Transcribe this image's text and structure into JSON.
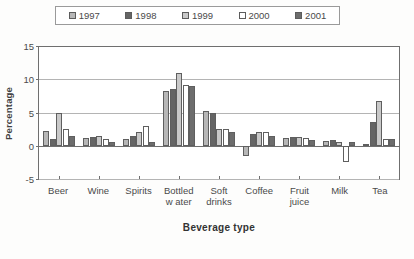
{
  "chart_data": {
    "type": "bar",
    "title": "",
    "xlabel": "Beverage type",
    "ylabel": "Percentage",
    "ylim": [
      -5,
      15
    ],
    "yticks": [
      15,
      10,
      5,
      0,
      -5
    ],
    "ytick_labels": [
      "15",
      "10",
      "5",
      "0",
      "-5"
    ],
    "grid": true,
    "legend_position": "top",
    "categories": [
      "Beer",
      "Wine",
      "Spirits",
      "Bottled\nw ater",
      "Soft\ndrinks",
      "Coffee",
      "Fruit\njuice",
      "Milk",
      "Tea"
    ],
    "series": [
      {
        "name": "1997",
        "color": "#b7b7b7",
        "values": [
          2.2,
          1.2,
          1.0,
          8.2,
          5.2,
          -1.5,
          1.2,
          0.7,
          0.3
        ]
      },
      {
        "name": "1998",
        "color": "#656565",
        "values": [
          1.0,
          1.3,
          1.5,
          8.5,
          5.0,
          1.8,
          1.3,
          0.8,
          3.5
        ]
      },
      {
        "name": "1999",
        "color": "#c9c9c9",
        "values": [
          5.0,
          1.5,
          2.0,
          11.0,
          2.5,
          2.0,
          1.3,
          0.5,
          6.8
        ]
      },
      {
        "name": "2000",
        "color": "#ffffff",
        "values": [
          2.5,
          1.0,
          3.0,
          9.2,
          2.5,
          2.0,
          1.2,
          -2.5,
          1.0
        ]
      },
      {
        "name": "2001",
        "color": "#6d6d6d",
        "values": [
          1.5,
          0.6,
          0.5,
          9.0,
          2.0,
          1.5,
          0.8,
          0.6,
          1.0
        ]
      }
    ]
  }
}
